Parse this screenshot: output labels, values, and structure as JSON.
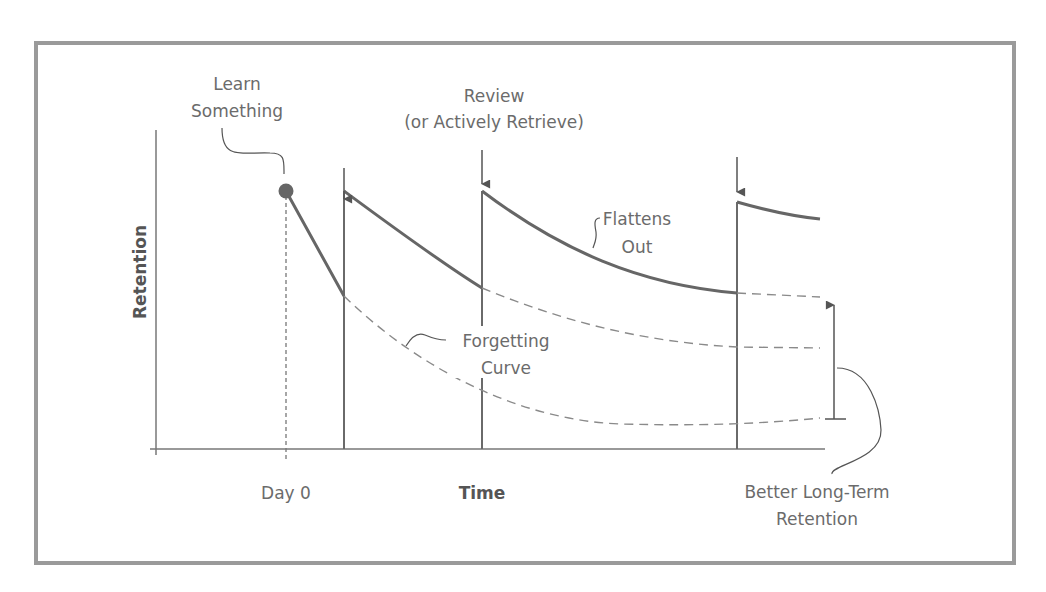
{
  "diagram": {
    "colors": {
      "frame": "#9a9a9a",
      "line": "#6a6a6a",
      "text": "#6b6b6b",
      "dashed": "#8a8a8a"
    },
    "axes": {
      "y_label": "Retention",
      "x_label": "Time",
      "x_tick_label": "Day 0"
    },
    "labels": {
      "learn_line1": "Learn",
      "learn_line2": "Something",
      "review_line1": "Review",
      "review_line2": "(or Actively Retrieve)",
      "flattens_line1": "Flattens",
      "flattens_line2": "Out",
      "forgetting_line1": "Forgetting",
      "forgetting_line2": "Curve",
      "better_line1": "Better Long-Term",
      "better_line2": "Retention"
    },
    "events": [
      {
        "name": "Day 0 (learn)",
        "x": 286
      },
      {
        "name": "Review 1",
        "x": 344
      },
      {
        "name": "Review 2",
        "x": 482
      },
      {
        "name": "Review 3",
        "x": 737
      }
    ]
  }
}
